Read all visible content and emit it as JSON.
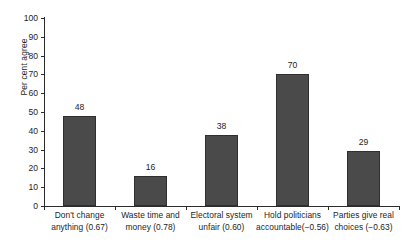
{
  "chart_data": {
    "type": "bar",
    "title": "",
    "xlabel": "",
    "ylabel": "Per cent agree",
    "ylim": [
      0,
      100
    ],
    "ytick_step": 10,
    "grid": false,
    "legend": false,
    "bar_color": "#4a4a4a",
    "bar_edge_color": "#2f2f2f",
    "axis_color": "#2b2b2b",
    "text_color": "#1d1d1d",
    "categories": [
      "Don't change anything (0.67)",
      "Waste time and money (0.78)",
      "Electoral system unfair (0.60)",
      "Hold politicians accountable(−0.56)",
      "Parties give real choices (−0.63)"
    ],
    "category_lines": [
      [
        "Don't change",
        "anything (0.67)"
      ],
      [
        "Waste time and",
        "money (0.78)"
      ],
      [
        "Electoral system",
        "unfair (0.60)"
      ],
      [
        "Hold politicians",
        "accountable(−0.56)"
      ],
      [
        "Parties give real",
        "choices (−0.63)"
      ]
    ],
    "loadings": [
      0.67,
      0.78,
      0.6,
      -0.56,
      -0.63
    ],
    "values": [
      48,
      16,
      38,
      70,
      29
    ],
    "value_labels": [
      "48",
      "16",
      "38",
      "70",
      "29"
    ],
    "ytick_labels": [
      "0",
      "10",
      "20",
      "30",
      "40",
      "50",
      "60",
      "70",
      "80",
      "90",
      "100"
    ],
    "ytick_values": [
      0,
      10,
      20,
      30,
      40,
      50,
      60,
      70,
      80,
      90,
      100
    ]
  }
}
